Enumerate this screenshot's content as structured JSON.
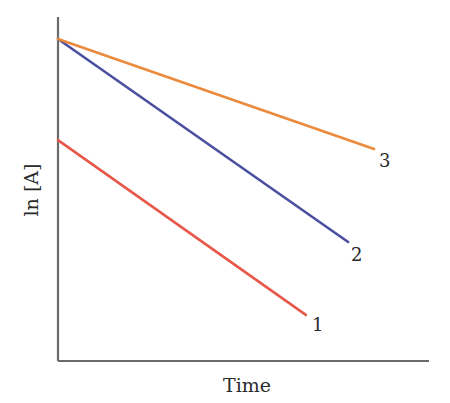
{
  "chart_data": {
    "type": "line",
    "title": "",
    "xlabel": "Time",
    "ylabel": "ln [A]",
    "xlim": [
      0,
      10
    ],
    "ylim": [
      0,
      10
    ],
    "grid": false,
    "ticks": false,
    "legend": "inline end labels",
    "series": [
      {
        "name": "1",
        "color": "#e8584a",
        "x": [
          0,
          6.68
        ],
        "y": [
          6.42,
          1.34
        ]
      },
      {
        "name": "2",
        "color": "#4a4fa0",
        "x": [
          0,
          7.82
        ],
        "y": [
          9.36,
          3.46
        ]
      },
      {
        "name": "3",
        "color": "#ea8a3c",
        "x": [
          0,
          8.52
        ],
        "y": [
          9.36,
          6.16
        ]
      }
    ]
  },
  "labels": {
    "xlabel": "Time",
    "ylabel": "ln [A]",
    "series1": "1",
    "series2": "2",
    "series3": "3"
  },
  "plot": {
    "origin_px": [
      58,
      361
    ],
    "x_end_px": 429,
    "y_top_px": 17
  }
}
